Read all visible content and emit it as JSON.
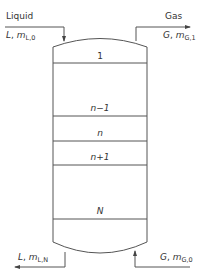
{
  "streams": {
    "liquid_in": {
      "title": "Liquid",
      "symbol": "L",
      "mass": "m",
      "sub": "L,0"
    },
    "gas_out": {
      "title": "Gas",
      "symbol": "G",
      "mass": "m",
      "sub": "G,1"
    },
    "liquid_out": {
      "symbol": "L",
      "mass": "m",
      "sub": "L,N"
    },
    "gas_in": {
      "symbol": "G",
      "mass": "m",
      "sub": "G,0"
    }
  },
  "stages": [
    {
      "label": "1"
    },
    {
      "label": "n−1"
    },
    {
      "label": "n"
    },
    {
      "label": "n+1"
    },
    {
      "label": "N"
    }
  ],
  "colors": {
    "line": "#555555",
    "text": "#333333",
    "background": "#ffffff"
  }
}
